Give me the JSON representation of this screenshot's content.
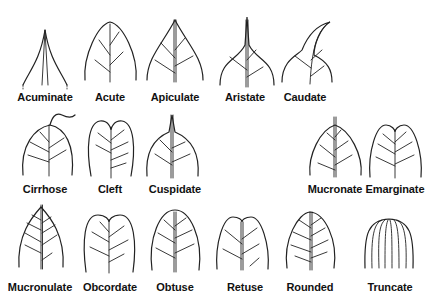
{
  "leaves": [
    {
      "id": "acuminate",
      "label": "Acuminate",
      "row": 1
    },
    {
      "id": "acute",
      "label": "Acute",
      "row": 1
    },
    {
      "id": "apiculate",
      "label": "Apiculate",
      "row": 1
    },
    {
      "id": "aristate",
      "label": "Aristate",
      "row": 1
    },
    {
      "id": "caudate",
      "label": "Caudate",
      "row": 1
    },
    {
      "id": "cirrhose",
      "label": "Cirrhose",
      "row": 2
    },
    {
      "id": "cleft",
      "label": "Cleft",
      "row": 2
    },
    {
      "id": "cuspidate",
      "label": "Cuspidate",
      "row": 2
    },
    {
      "id": "mucronate",
      "label": "Mucronate",
      "row": 2
    },
    {
      "id": "emarginate",
      "label": "Emarginate",
      "row": 2
    },
    {
      "id": "mucronulate",
      "label": "Mucronulate",
      "row": 3
    },
    {
      "id": "obcordate",
      "label": "Obcordate",
      "row": 3
    },
    {
      "id": "obtuse",
      "label": "Obtuse",
      "row": 3
    },
    {
      "id": "retuse",
      "label": "Retuse",
      "row": 3
    },
    {
      "id": "rounded",
      "label": "Rounded",
      "row": 3
    },
    {
      "id": "truncate",
      "label": "Truncate",
      "row": 3
    }
  ]
}
